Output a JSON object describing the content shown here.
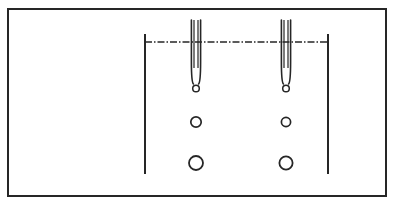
{
  "figure": {
    "type": "technical-line-diagram",
    "title": "",
    "caption": "",
    "canvas": {
      "width": 394,
      "height": 205
    },
    "background_color": "#ffffff",
    "stroke_color": "#262626",
    "frame": {
      "name": "outer-border",
      "x": 8,
      "y": 9,
      "width": 378,
      "height": 187,
      "stroke_width": 2.0,
      "fill": "none"
    },
    "vessel": {
      "name": "vessel-walls",
      "left_wall_x": 145,
      "right_wall_x": 328,
      "wall_top_y": 34,
      "wall_bottom_y": 174,
      "stroke_width": 2.0
    },
    "liquid_level": {
      "name": "liquid-surface-line",
      "x1": 145,
      "x2": 328,
      "y": 42,
      "style": "dash-dot",
      "dash_pattern": "7 2 1.5 2",
      "stroke_width": 1.3
    },
    "nozzles": [
      {
        "name": "nozzle-left",
        "center_x": 196,
        "top_y": 20,
        "tip_y": 84,
        "outer_half_width": 4.6,
        "inner_gap": 2.0,
        "taper_start_y": 62,
        "stroke_width": 1.6,
        "tip_bubble": {
          "cx": 196,
          "cy": 88.5,
          "r": 3.3,
          "stroke_width": 1.5
        }
      },
      {
        "name": "nozzle-right",
        "center_x": 286,
        "top_y": 20,
        "tip_y": 84,
        "outer_half_width": 4.6,
        "inner_gap": 2.0,
        "taper_start_y": 62,
        "stroke_width": 1.6,
        "tip_bubble": {
          "cx": 286,
          "cy": 88.5,
          "r": 3.3,
          "stroke_width": 1.5
        }
      }
    ],
    "bubbles": [
      {
        "name": "bubble-left-middle",
        "cx": 196,
        "cy": 122,
        "r": 5.2,
        "stroke_width": 1.7
      },
      {
        "name": "bubble-right-middle",
        "cx": 286,
        "cy": 122,
        "r": 4.6,
        "stroke_width": 1.7
      },
      {
        "name": "bubble-left-bottom",
        "cx": 196,
        "cy": 163,
        "r": 7.0,
        "stroke_width": 1.8
      },
      {
        "name": "bubble-right-bottom",
        "cx": 286,
        "cy": 163,
        "r": 6.6,
        "stroke_width": 1.8
      }
    ]
  }
}
